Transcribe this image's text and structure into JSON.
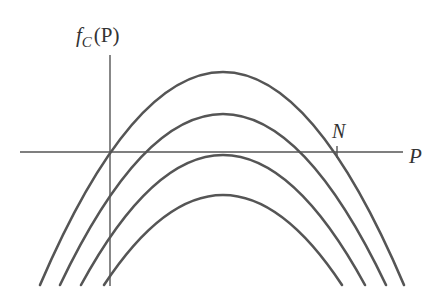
{
  "diagram": {
    "type": "function-graph",
    "y_axis_label": {
      "main": "f",
      "subscript": "C",
      "arg": "(P)"
    },
    "x_axis_label": "P",
    "point_label": "N",
    "colors": {
      "line": "#555555",
      "axis": "#555555",
      "text": "#333333",
      "background": "#ffffff"
    },
    "axes": {
      "origin": [
        110,
        152
      ],
      "y_axis": {
        "x": 110,
        "y_top": 55,
        "y_bottom": 286
      },
      "x_axis": {
        "y": 152,
        "x_left": 20,
        "x_right": 403
      }
    },
    "curves": [
      {
        "name": "curve-1",
        "peak": [
          223,
          72
        ],
        "left_end": [
          40,
          285
        ],
        "right_end": [
          404,
          285
        ]
      },
      {
        "name": "curve-2",
        "peak": [
          223,
          114
        ],
        "left_end": [
          60,
          285
        ],
        "right_end": [
          386,
          285
        ]
      },
      {
        "name": "curve-3",
        "peak": [
          223,
          155
        ],
        "left_end": [
          81,
          285
        ],
        "right_end": [
          365,
          285
        ]
      },
      {
        "name": "curve-4",
        "peak": [
          223,
          195
        ],
        "left_end": [
          104,
          285
        ],
        "right_end": [
          342,
          285
        ]
      }
    ],
    "tick_N": {
      "x": 337,
      "y": 152
    }
  }
}
